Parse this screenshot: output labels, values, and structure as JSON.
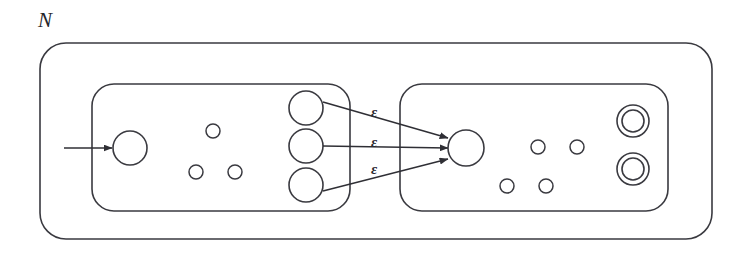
{
  "figure": {
    "outer_label": "N",
    "stroke_color": "#3a3a40",
    "fill_color": "#ffffff",
    "background": "#ffffff",
    "width": 745,
    "height": 261
  },
  "outer_box": {
    "name": "combined-nfa-N",
    "label": "N",
    "label_x": 38,
    "label_y": 10,
    "x": 40,
    "y": 43,
    "width": 672,
    "height": 196,
    "radius": 26
  },
  "left_machine": {
    "name": "nfa-N1",
    "x": 92,
    "y": 84,
    "width": 258,
    "height": 127,
    "radius": 22,
    "start_arrow": {
      "label": "start-arrow",
      "x1": 64,
      "y1": 148,
      "x2": 112,
      "y2": 148
    },
    "start_state": {
      "cx": 130,
      "cy": 148,
      "r": 17
    },
    "inner_dots": [
      {
        "cx": 213,
        "cy": 131,
        "r": 7
      },
      {
        "cx": 196,
        "cy": 172,
        "r": 7
      },
      {
        "cx": 235,
        "cy": 172,
        "r": 7
      }
    ],
    "accept_states": [
      {
        "cx": 306,
        "cy": 108,
        "r": 17
      },
      {
        "cx": 306,
        "cy": 146,
        "r": 17
      },
      {
        "cx": 306,
        "cy": 185,
        "r": 17
      }
    ]
  },
  "right_machine": {
    "name": "nfa-N2",
    "x": 400,
    "y": 84,
    "width": 268,
    "height": 127,
    "radius": 22,
    "start_state": {
      "cx": 466,
      "cy": 148,
      "r": 18
    },
    "inner_dots": [
      {
        "cx": 538,
        "cy": 147,
        "r": 7
      },
      {
        "cx": 577,
        "cy": 147,
        "r": 7
      },
      {
        "cx": 507,
        "cy": 186,
        "r": 7
      },
      {
        "cx": 546,
        "cy": 186,
        "r": 7
      }
    ],
    "accept_states": [
      {
        "cx": 633,
        "cy": 121,
        "r": 16,
        "inner_r": 11
      },
      {
        "cx": 633,
        "cy": 169,
        "r": 16,
        "inner_r": 11
      }
    ]
  },
  "epsilon_transitions": [
    {
      "name": "epsilon-transition-top",
      "label": "ε",
      "label_x": 371,
      "label_y": 105,
      "x1": 323,
      "y1": 102,
      "x2": 448,
      "y2": 138
    },
    {
      "name": "epsilon-transition-middle",
      "label": "ε",
      "label_x": 371,
      "label_y": 135,
      "x1": 323,
      "y1": 146,
      "x2": 448,
      "y2": 148
    },
    {
      "name": "epsilon-transition-bottom",
      "label": "ε",
      "label_x": 371,
      "label_y": 162,
      "x1": 323,
      "y1": 191,
      "x2": 448,
      "y2": 159
    }
  ]
}
